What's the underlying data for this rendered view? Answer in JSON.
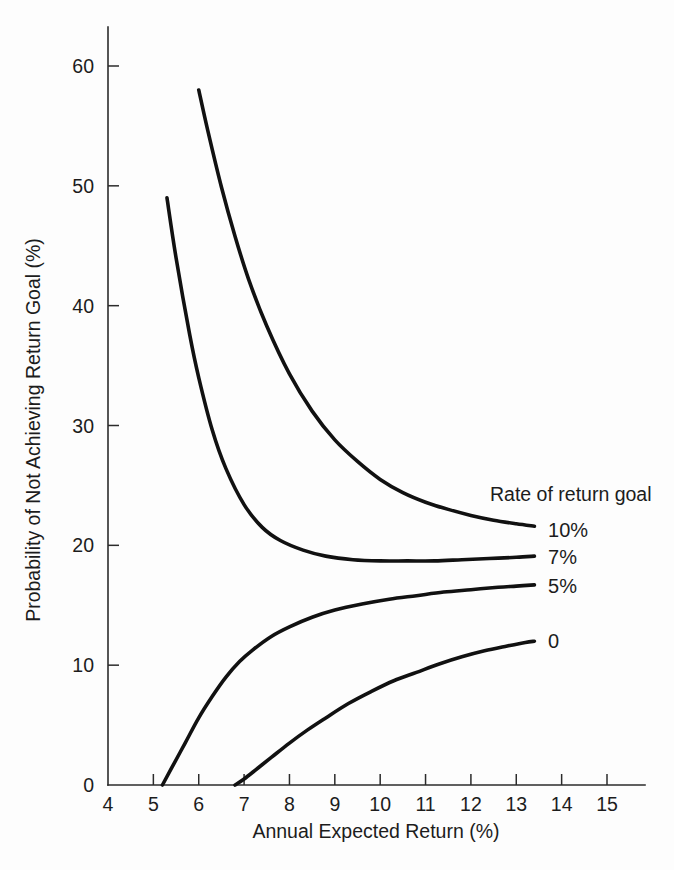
{
  "chart_data": {
    "type": "line",
    "title": "",
    "subtitle": "",
    "xlabel": "Annual Expected Return (%)",
    "ylabel": "Probability of Not Achieving Return Goal (%)",
    "xlim": [
      4,
      15
    ],
    "ylim": [
      0,
      64
    ],
    "xticks": [
      4,
      5,
      6,
      7,
      8,
      9,
      10,
      11,
      12,
      13,
      14,
      15
    ],
    "xtick_labels": [
      "4",
      "5",
      "6",
      "7",
      "8",
      "9",
      "10",
      "11",
      "12",
      "13",
      "14",
      "15"
    ],
    "yticks": [
      0,
      10,
      20,
      30,
      40,
      50,
      60
    ],
    "ytick_labels": [
      "0",
      "10",
      "20",
      "30",
      "40",
      "50",
      "60"
    ],
    "grid": false,
    "legend_position": "right-inline",
    "legend_title": "Rate of return goal",
    "line_color": "#111111",
    "axis_color": "#2b2b2b",
    "background_color": "#fdfdfd",
    "series": [
      {
        "name": "10%",
        "label": "10%",
        "label_x": 13.7,
        "label_y": 21.3,
        "x": [
          6.0,
          6.2,
          6.5,
          6.8,
          7.1,
          7.5,
          8.0,
          8.5,
          9.0,
          9.5,
          10.0,
          10.5,
          11.0,
          11.5,
          12.0,
          12.5,
          13.0,
          13.4
        ],
        "y": [
          58.0,
          54.6,
          49.9,
          45.8,
          42.2,
          38.3,
          34.3,
          31.2,
          28.8,
          27.0,
          25.5,
          24.4,
          23.6,
          23.0,
          22.5,
          22.1,
          21.8,
          21.6
        ]
      },
      {
        "name": "7%",
        "label": "7%",
        "label_x": 13.7,
        "label_y": 19.0,
        "x": [
          5.3,
          5.5,
          5.8,
          6.0,
          6.3,
          6.6,
          7.0,
          7.4,
          7.8,
          8.3,
          8.8,
          9.4,
          10.0,
          10.6,
          11.2,
          11.8,
          12.4,
          13.0,
          13.4
        ],
        "y": [
          49.0,
          44.0,
          37.6,
          34.0,
          29.6,
          26.4,
          23.4,
          21.5,
          20.4,
          19.6,
          19.1,
          18.8,
          18.7,
          18.7,
          18.7,
          18.8,
          18.9,
          19.0,
          19.1
        ]
      },
      {
        "name": "5%",
        "label": "5%",
        "label_x": 13.7,
        "label_y": 16.6,
        "x": [
          5.2,
          5.4,
          5.7,
          6.0,
          6.3,
          6.6,
          6.9,
          7.2,
          7.6,
          8.0,
          8.5,
          9.0,
          9.6,
          10.2,
          10.8,
          11.4,
          12.0,
          12.6,
          13.0,
          13.4
        ],
        "y": [
          0.0,
          1.4,
          3.5,
          5.6,
          7.4,
          9.0,
          10.3,
          11.3,
          12.4,
          13.2,
          14.0,
          14.6,
          15.1,
          15.5,
          15.8,
          16.1,
          16.3,
          16.5,
          16.6,
          16.7
        ]
      },
      {
        "name": "0",
        "label": "0",
        "label_x": 13.7,
        "label_y": 12.0,
        "x": [
          6.8,
          7.0,
          7.3,
          7.6,
          8.0,
          8.4,
          8.8,
          9.3,
          9.8,
          10.3,
          10.8,
          11.3,
          11.8,
          12.3,
          12.8,
          13.2,
          13.4
        ],
        "y": [
          0.0,
          0.5,
          1.4,
          2.3,
          3.5,
          4.6,
          5.6,
          6.8,
          7.8,
          8.7,
          9.4,
          10.1,
          10.7,
          11.2,
          11.6,
          11.9,
          12.0
        ]
      }
    ]
  },
  "figure": {
    "caption": ""
  }
}
